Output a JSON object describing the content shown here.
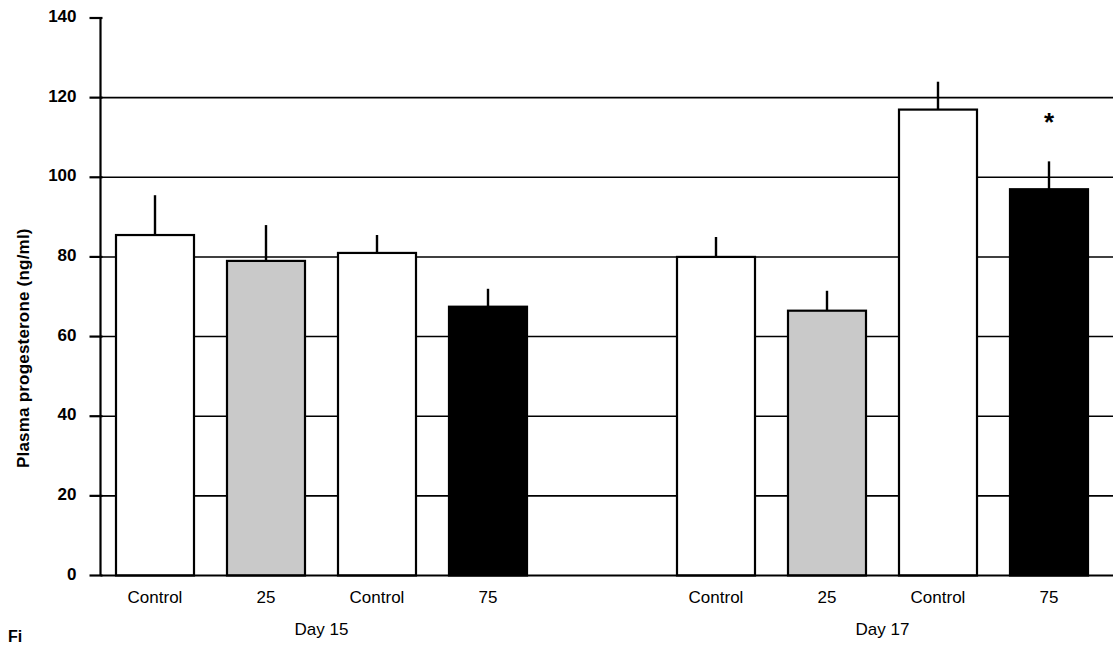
{
  "figure": {
    "caption_fragment": "Fi"
  },
  "chart_data": {
    "type": "bar",
    "title": "",
    "xlabel": "",
    "ylabel": "Plasma progesterone (ng/ml)",
    "ylim": [
      0,
      140
    ],
    "ytick_step": 20,
    "ytick_labels": [
      "0",
      "20",
      "40",
      "60",
      "80",
      "100",
      "120",
      "140"
    ],
    "ytick_values": [
      0,
      20,
      40,
      60,
      80,
      100,
      120,
      140
    ],
    "grid": "horizontal gridlines at 20,40,60,80,100,120 spanning plot width",
    "legend": "none",
    "groups": [
      {
        "name": "Day 15",
        "label": "Day 15",
        "categories": [
          "Control",
          "25",
          "Control",
          "75"
        ],
        "values": [
          85.5,
          79.0,
          81.0,
          67.5
        ],
        "errors_upper": [
          95.5,
          88.0,
          85.5,
          72.0
        ],
        "fills": [
          "white",
          "gray",
          "white",
          "black"
        ],
        "significance": [
          "",
          "",
          "",
          ""
        ]
      },
      {
        "name": "Day 17",
        "label": "Day 17",
        "categories": [
          "Control",
          "25",
          "Control",
          "75"
        ],
        "values": [
          80.0,
          66.5,
          117.0,
          97.0
        ],
        "errors_upper": [
          85.0,
          71.5,
          124.0,
          104.0
        ],
        "fills": [
          "white",
          "gray",
          "white",
          "black"
        ],
        "significance": [
          "",
          "",
          "",
          "*"
        ]
      }
    ],
    "colors": {
      "white": "#ffffff",
      "gray": "#c9c9c9",
      "black": "#000000",
      "stroke": "#000000",
      "background": "#ffffff"
    },
    "annotations": [
      {
        "text": "*",
        "group": "Day 17",
        "category": "75",
        "meaning": "significant difference marker"
      }
    ]
  }
}
